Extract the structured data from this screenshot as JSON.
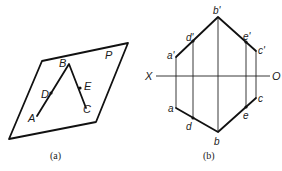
{
  "figure_a": {
    "caption": "(a)",
    "plane_label": "P",
    "points": {
      "A": "A",
      "B": "B",
      "C": "C",
      "D": "D",
      "E": "E"
    }
  },
  "figure_b": {
    "caption": "(b)",
    "axis": {
      "left": "X",
      "right": "O"
    },
    "points": {
      "a_prime": "a'",
      "b_prime": "b'",
      "c_prime": "c'",
      "d_prime": "d'",
      "e_prime": "e'",
      "a": "a",
      "b": "b",
      "c": "c",
      "d": "d",
      "e": "e"
    }
  },
  "colors": {
    "line": "#111111",
    "background": "#ffffff"
  }
}
